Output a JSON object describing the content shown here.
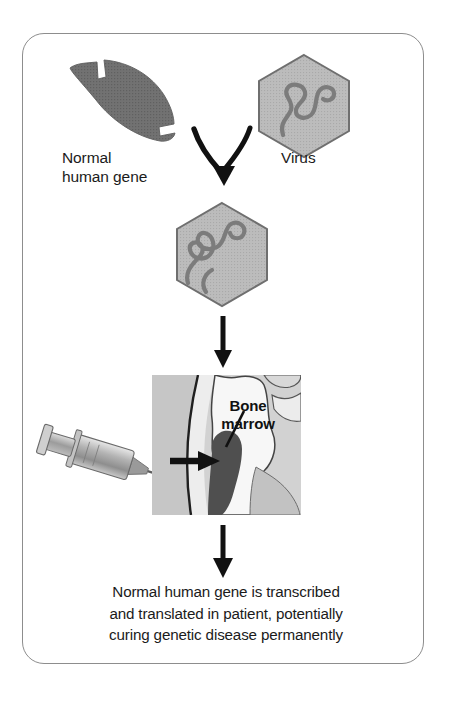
{
  "figure": {
    "frame_color": "#8d8d8d",
    "background_color": "#ffffff"
  },
  "palette": {
    "gene_gray": "#6e6e6e",
    "hexagon_fill": "#b9b9b9",
    "hexagon_stroke": "#6f6f6f",
    "dna_squiggle": "#7a7a7a",
    "arrow_black": "#111111",
    "marrow_dark": "#4a4a4a",
    "bone_light": "#f2f2f2",
    "bone_mid": "#c4c4c4",
    "image_bg": "#cfcfcf",
    "text_color": "#1b1b1b"
  },
  "labels": {
    "normal_gene": "Normal\nhuman gene",
    "virus": "Virus",
    "bone_marrow": "Bone\nmarrow"
  },
  "caption": {
    "line1": "Normal human gene is transcribed",
    "line2": "and translated in patient, potentially",
    "line3": "curing genetic disease permanently"
  },
  "shapes": {
    "normal_gene_shape": "curved-gray-arc-gene-segment",
    "virus_shape": "gray-hexagon-with-dna-squiggle",
    "recombinant_virus_shape": "gray-hexagon-with-longer-dna-squiggle",
    "merge_arrow": "v-shaped-merging-arrow-down",
    "arrow_to_patient": "straight-arrow-down",
    "arrow_to_caption": "straight-arrow-down",
    "syringe": "syringe-with-needle-pointing-right",
    "injection_arrow": "short-black-arrow-right",
    "bone_marrow_pointer": "leader-line-to-marrow"
  },
  "steps": [
    {
      "id": 1,
      "element": "normal-human-gene",
      "label": "Normal human gene"
    },
    {
      "id": 2,
      "element": "virus",
      "label": "Virus"
    },
    {
      "id": 3,
      "element": "recombinant-virus",
      "label": ""
    },
    {
      "id": 4,
      "element": "bone-marrow-injection",
      "label": "Bone marrow"
    },
    {
      "id": 5,
      "element": "outcome-caption",
      "label": "Normal human gene is transcribed and translated in patient, potentially curing genetic disease permanently"
    }
  ]
}
